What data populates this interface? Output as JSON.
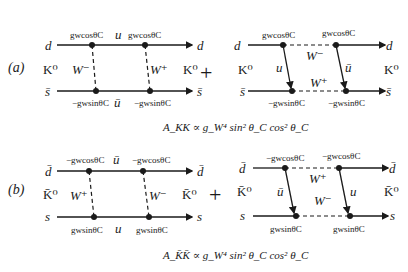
{
  "diagrams": {
    "a": {
      "label": "(a)",
      "left": {
        "top_in": "d",
        "top_out": "d",
        "bottom_in": "s̄",
        "bottom_out": "s̄",
        "meson_in": "K⁰",
        "meson_out": "K⁰",
        "top_vertex_1": "gwcosθC",
        "top_vertex_2": "gwcosθC",
        "top_internal": "u",
        "bottom_vertex_1": "−gwsinθC",
        "bottom_vertex_2": "−gwsinθC",
        "bottom_internal": "ū",
        "boson_1": "W⁻",
        "boson_2": "W⁺"
      },
      "plus": "+",
      "right": {
        "top_in": "d",
        "top_out": "d",
        "bottom_in": "s̄",
        "bottom_out": "s̄",
        "meson_in": "K⁰",
        "meson_out": "K⁰",
        "top_vertex_1": "gwcosθC",
        "top_vertex_2": "gwcosθC",
        "bottom_vertex_1": "−gwsinθC",
        "bottom_vertex_2": "−gwsinθC",
        "quark_1": "u",
        "quark_2": "ū",
        "boson_top": "W⁻",
        "boson_bottom": "W⁺"
      },
      "amplitude": "A_KK ∝ g_W⁴ sin² θ_C cos² θ_C"
    },
    "b": {
      "label": "(b)",
      "left": {
        "top_in": "d̄",
        "top_out": "d̄",
        "bottom_in": "s",
        "bottom_out": "s",
        "meson_in": "K̄⁰",
        "meson_out": "K̄⁰",
        "top_vertex_1": "−gwcosθC",
        "top_vertex_2": "−gwcosθC",
        "top_internal": "ū",
        "bottom_vertex_1": "gwsinθC",
        "bottom_vertex_2": "gwsinθC",
        "bottom_internal": "u",
        "boson_1": "W⁺",
        "boson_2": "W⁻"
      },
      "plus": "+",
      "right": {
        "top_in": "d̄",
        "top_out": "d̄",
        "bottom_in": "s",
        "bottom_out": "s",
        "meson_in": "K̄⁰",
        "meson_out": "K̄⁰",
        "top_vertex_1": "−gwcosθC",
        "top_vertex_2": "−gwcosθC",
        "bottom_vertex_1": "gwsinθC",
        "bottom_vertex_2": "gwsinθC",
        "quark_1": "ū",
        "quark_2": "u",
        "boson_top": "W⁺",
        "boson_bottom": "W⁻"
      },
      "amplitude": "A_K̄K̄ ∝ g_W⁴ sin² θ_C cos² θ_C"
    }
  },
  "colors": {
    "line": "#1a1a1a",
    "background": "#ffffff"
  }
}
